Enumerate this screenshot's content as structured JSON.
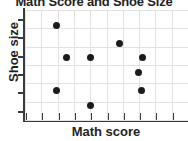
{
  "chart_data": {
    "type": "scatter",
    "title": "Math Score and Shoe Size",
    "xlabel": "Math score",
    "ylabel": "Shoe size",
    "grid": true,
    "legend": null,
    "xlim": [
      0,
      10.5
    ],
    "ylim": [
      0,
      7
    ],
    "x_tick_count": 11,
    "y_tick_count": 6,
    "x_tick_labels": [],
    "y_tick_labels": [],
    "points": [
      {
        "label": "point-1",
        "x": 2.0,
        "y": 6.0
      },
      {
        "label": "point-2",
        "x": 2.0,
        "y": 1.9
      },
      {
        "label": "point-3",
        "x": 2.7,
        "y": 4.0
      },
      {
        "label": "point-4",
        "x": 4.2,
        "y": 4.0
      },
      {
        "label": "point-5",
        "x": 4.2,
        "y": 0.9
      },
      {
        "label": "point-6",
        "x": 6.1,
        "y": 4.9
      },
      {
        "label": "point-7",
        "x": 7.3,
        "y": 3.0
      },
      {
        "label": "point-8",
        "x": 7.5,
        "y": 1.9
      },
      {
        "label": "point-9",
        "x": 7.6,
        "y": 4.0
      }
    ]
  },
  "chart": {
    "title": "Math Score and Shoe Size",
    "x_axis_label": "Math score",
    "y_axis_label": "Shoe size",
    "marker_color": "#1c1c1c",
    "grid_color": "#e2e2e2",
    "axis_color": "#3b3b3b",
    "text_color": "#221f1f",
    "background_color": "#ffffff"
  }
}
